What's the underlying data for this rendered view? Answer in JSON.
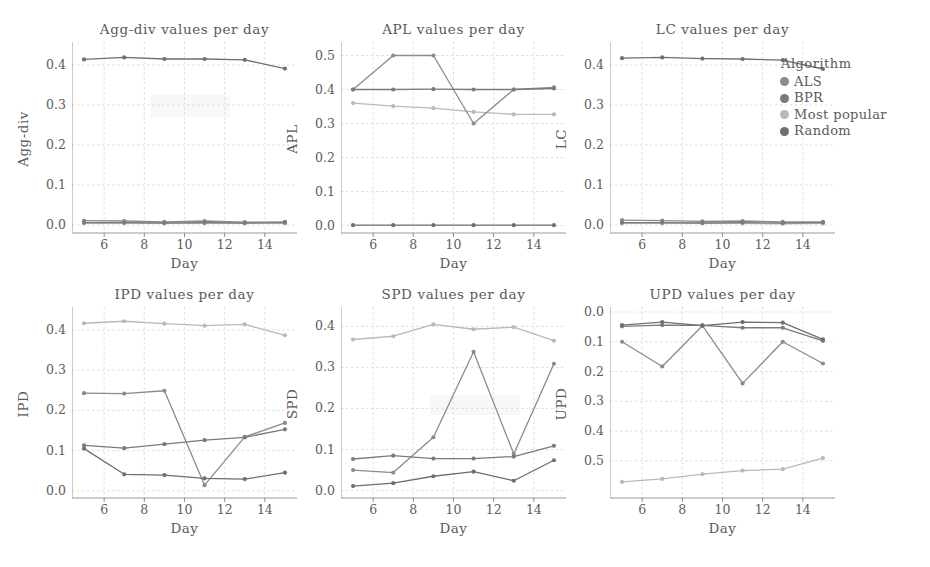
{
  "figure": {
    "xlabel": "Day",
    "legend": {
      "title": "Algorithm",
      "items": [
        {
          "label": "ALS",
          "color": "#8b8b8b"
        },
        {
          "label": "BPR",
          "color": "#7a7a7a"
        },
        {
          "label": "Most popular",
          "color": "#b9b9b9"
        },
        {
          "label": "Random",
          "color": "#6f6f6f"
        }
      ]
    }
  },
  "chart_data": [
    {
      "type": "line",
      "title": "Agg-div values per day",
      "xlabel": "Day",
      "ylabel": "Agg-div",
      "x": [
        5,
        7,
        9,
        11,
        13,
        15
      ],
      "xlim": [
        4.4,
        15.6
      ],
      "xticks": [
        6,
        8,
        10,
        12,
        14
      ],
      "ylim": [
        -0.02,
        0.445
      ],
      "yticks": [
        0.0,
        0.1,
        0.2,
        0.3,
        0.4
      ],
      "ytick_labels": [
        "0.0",
        "0.1",
        "0.2",
        "0.3",
        "0.4"
      ],
      "grid": true,
      "legend_position": "outside-right",
      "series": [
        {
          "name": "ALS",
          "color": "#8b8b8b",
          "values": [
            0.011,
            0.01,
            0.008,
            0.01,
            0.007,
            0.008
          ]
        },
        {
          "name": "BPR",
          "color": "#7a7a7a",
          "values": [
            0.006,
            0.006,
            0.005,
            0.006,
            0.005,
            0.006
          ]
        },
        {
          "name": "Most popular",
          "color": "#b9b9b9",
          "values": [
            0.004,
            0.004,
            0.004,
            0.004,
            0.004,
            0.004
          ]
        },
        {
          "name": "Random",
          "color": "#6f6f6f",
          "values": [
            0.414,
            0.419,
            0.415,
            0.415,
            0.413,
            0.391
          ]
        }
      ]
    },
    {
      "type": "line",
      "title": "APL values per day",
      "xlabel": "Day",
      "ylabel": "APL",
      "x": [
        5,
        7,
        9,
        11,
        13,
        15
      ],
      "xlim": [
        4.4,
        15.6
      ],
      "xticks": [
        6,
        8,
        10,
        12,
        14
      ],
      "ylim": [
        -0.022,
        0.525
      ],
      "yticks": [
        0.0,
        0.1,
        0.2,
        0.3,
        0.4,
        0.5
      ],
      "ytick_labels": [
        "0.0",
        "0.1",
        "0.2",
        "0.3",
        "0.4",
        "0.5"
      ],
      "grid": true,
      "legend_position": "outside-right",
      "series": [
        {
          "name": "ALS",
          "color": "#8b8b8b",
          "values": [
            0.4,
            0.5,
            0.5,
            0.3,
            0.4,
            0.406
          ]
        },
        {
          "name": "BPR",
          "color": "#7a7a7a",
          "values": [
            0.4,
            0.4,
            0.401,
            0.4,
            0.4,
            0.403
          ]
        },
        {
          "name": "Most popular",
          "color": "#b9b9b9",
          "values": [
            0.36,
            0.351,
            0.345,
            0.334,
            0.327,
            0.327
          ]
        },
        {
          "name": "Random",
          "color": "#6f6f6f",
          "values": [
            0.001,
            0.001,
            0.001,
            0.001,
            0.001,
            0.001
          ]
        }
      ]
    },
    {
      "type": "line",
      "title": "LC values per day",
      "xlabel": "Day",
      "ylabel": "LC",
      "x": [
        5,
        7,
        9,
        11,
        13,
        15
      ],
      "xlim": [
        4.4,
        15.6
      ],
      "xticks": [
        6,
        8,
        10,
        12,
        14
      ],
      "ylim": [
        -0.02,
        0.445
      ],
      "yticks": [
        0.0,
        0.1,
        0.2,
        0.3,
        0.4
      ],
      "ytick_labels": [
        "0.0",
        "0.1",
        "0.2",
        "0.3",
        "0.4"
      ],
      "grid": true,
      "legend_position": "outside-right",
      "series": [
        {
          "name": "ALS",
          "color": "#8b8b8b",
          "values": [
            0.012,
            0.011,
            0.009,
            0.01,
            0.008,
            0.008
          ]
        },
        {
          "name": "BPR",
          "color": "#7a7a7a",
          "values": [
            0.006,
            0.006,
            0.005,
            0.006,
            0.005,
            0.006
          ]
        },
        {
          "name": "Most popular",
          "color": "#b9b9b9",
          "values": [
            0.004,
            0.004,
            0.004,
            0.004,
            0.003,
            0.004
          ]
        },
        {
          "name": "Random",
          "color": "#6f6f6f",
          "values": [
            0.417,
            0.419,
            0.416,
            0.415,
            0.412,
            0.39
          ]
        }
      ]
    },
    {
      "type": "line",
      "title": "IPD values per day",
      "xlabel": "Day",
      "ylabel": "IPD",
      "x": [
        5,
        7,
        9,
        11,
        13,
        15
      ],
      "xlim": [
        4.4,
        15.6
      ],
      "xticks": [
        6,
        8,
        10,
        12,
        14
      ],
      "ylim": [
        -0.018,
        0.445
      ],
      "yticks": [
        0.0,
        0.1,
        0.2,
        0.3,
        0.4
      ],
      "ytick_labels": [
        "0.0",
        "0.1",
        "0.2",
        "0.3",
        "0.4"
      ],
      "grid": true,
      "legend_position": "outside-right",
      "series": [
        {
          "name": "ALS",
          "color": "#8b8b8b",
          "values": [
            0.243,
            0.242,
            0.249,
            0.014,
            0.134,
            0.169
          ]
        },
        {
          "name": "BPR",
          "color": "#7a7a7a",
          "values": [
            0.113,
            0.106,
            0.116,
            0.126,
            0.133,
            0.153
          ]
        },
        {
          "name": "Most popular",
          "color": "#b9b9b9",
          "values": [
            0.417,
            0.422,
            0.416,
            0.411,
            0.414,
            0.387
          ]
        },
        {
          "name": "Random",
          "color": "#6f6f6f",
          "values": [
            0.105,
            0.041,
            0.039,
            0.031,
            0.029,
            0.045
          ]
        }
      ]
    },
    {
      "type": "line",
      "title": "SPD values per day",
      "xlabel": "Day",
      "ylabel": "SPD",
      "x": [
        5,
        7,
        9,
        11,
        13,
        15
      ],
      "xlim": [
        4.4,
        15.6
      ],
      "xticks": [
        6,
        8,
        10,
        12,
        14
      ],
      "ylim": [
        -0.018,
        0.435
      ],
      "yticks": [
        0.0,
        0.1,
        0.2,
        0.3,
        0.4
      ],
      "ytick_labels": [
        "0.0",
        "0.1",
        "0.2",
        "0.3",
        "0.4"
      ],
      "grid": true,
      "legend_position": "outside-right",
      "series": [
        {
          "name": "ALS",
          "color": "#8b8b8b",
          "values": [
            0.05,
            0.044,
            0.13,
            0.338,
            0.089,
            0.309
          ]
        },
        {
          "name": "BPR",
          "color": "#7a7a7a",
          "values": [
            0.077,
            0.085,
            0.078,
            0.078,
            0.083,
            0.109
          ]
        },
        {
          "name": "Most popular",
          "color": "#b9b9b9",
          "values": [
            0.368,
            0.376,
            0.405,
            0.393,
            0.398,
            0.365
          ]
        },
        {
          "name": "Random",
          "color": "#6f6f6f",
          "values": [
            0.011,
            0.018,
            0.035,
            0.046,
            0.024,
            0.074
          ]
        }
      ]
    },
    {
      "type": "line",
      "title": "UPD values per day",
      "xlabel": "Day",
      "ylabel": "UPD",
      "x": [
        5,
        7,
        9,
        11,
        13,
        15
      ],
      "xlim": [
        4.4,
        15.6
      ],
      "xticks": [
        6,
        8,
        10,
        12,
        14
      ],
      "ylim": [
        0.0,
        0.625
      ],
      "y_inverted": true,
      "yticks": [
        0.0,
        0.1,
        0.2,
        0.3,
        0.4,
        0.5
      ],
      "ytick_labels": [
        "0.0",
        "0.1",
        "0.2",
        "0.3",
        "0.4",
        "0.5"
      ],
      "grid": true,
      "legend_position": "outside-right",
      "series": [
        {
          "name": "ALS",
          "color": "#8b8b8b",
          "values": [
            0.1,
            0.183,
            0.046,
            0.24,
            0.1,
            0.173
          ]
        },
        {
          "name": "BPR",
          "color": "#7a7a7a",
          "values": [
            0.048,
            0.044,
            0.045,
            0.053,
            0.053,
            0.097
          ]
        },
        {
          "name": "Most popular",
          "color": "#b9b9b9",
          "values": [
            0.571,
            0.561,
            0.545,
            0.533,
            0.528,
            0.491
          ]
        },
        {
          "name": "Random",
          "color": "#6f6f6f",
          "values": [
            0.044,
            0.034,
            0.046,
            0.034,
            0.036,
            0.092
          ]
        }
      ]
    }
  ]
}
